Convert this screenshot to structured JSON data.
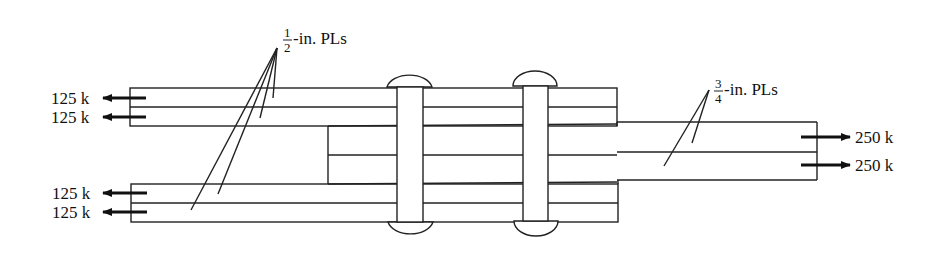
{
  "diagram": {
    "type": "riveted splice joint (side view)",
    "colors": {
      "line": "#222222",
      "background": "#ffffff"
    },
    "labels": {
      "half_inch": {
        "num": "1",
        "den": "2",
        "suffix": "-in. PLs"
      },
      "three_quarter_inch": {
        "num": "3",
        "den": "4",
        "suffix": "-in. PLs"
      }
    },
    "loads_left": [
      "125 k",
      "125 k",
      "125 k",
      "125 k"
    ],
    "loads_right": [
      "250 k",
      "250 k"
    ],
    "rivets": 2
  }
}
